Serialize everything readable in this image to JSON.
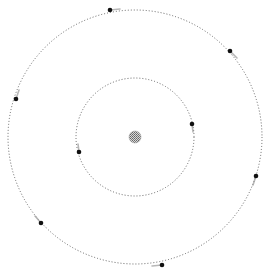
{
  "diagram": {
    "type": "orbital-system",
    "width": 266,
    "height": 272,
    "background": "#ffffff",
    "center": {
      "x": 135,
      "y": 137
    },
    "sun": {
      "radius": 6,
      "color": "#8a8a8a"
    },
    "orbits": [
      {
        "name": "inner-orbit",
        "radius": 59,
        "stroke": "#555555",
        "planets": [
          {
            "x": 192,
            "y": 124,
            "trail_dx": 1,
            "trail_dy": 8
          },
          {
            "x": 79,
            "y": 152,
            "trail_dx": -1,
            "trail_dy": -8
          }
        ]
      },
      {
        "name": "outer-orbit",
        "radius": 127,
        "stroke": "#555555",
        "planets": [
          {
            "x": 110,
            "y": 10,
            "trail_dx": 10,
            "trail_dy": -1
          },
          {
            "x": 230,
            "y": 51,
            "trail_dx": 7,
            "trail_dy": 7
          },
          {
            "x": 16,
            "y": 99,
            "trail_dx": 3,
            "trail_dy": -9
          },
          {
            "x": 256,
            "y": 176,
            "trail_dx": -3,
            "trail_dy": 9
          },
          {
            "x": 41,
            "y": 223,
            "trail_dx": -6,
            "trail_dy": -7
          },
          {
            "x": 162,
            "y": 265,
            "trail_dx": -10,
            "trail_dy": 1
          }
        ]
      }
    ],
    "planet_color": "#111111",
    "planet_radius": 2.3
  }
}
